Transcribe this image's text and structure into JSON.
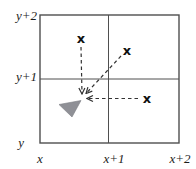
{
  "diagram": {
    "axis": {
      "y_labels": [
        "y+2",
        "y+1",
        "y"
      ],
      "x_labels": [
        "x",
        "x+1",
        "x+2"
      ]
    },
    "grid": {
      "rows": 2,
      "cols": 2,
      "line_color": "#4f4f4f"
    },
    "markers": {
      "glyph": "x",
      "color": "#101010",
      "points": [
        {
          "px": 81,
          "py": 38,
          "approx": "x+0.6, y+1.6"
        },
        {
          "px": 127,
          "py": 50,
          "approx": "x+1.25, y+1.45"
        },
        {
          "px": 147,
          "py": 98,
          "approx": "x+1.55, y+0.7"
        }
      ]
    },
    "arrows": {
      "color": "#333333",
      "dash": "3.5 3",
      "lines": [
        {
          "x1": 81,
          "y1": 47,
          "x2": 82,
          "y2": 94
        },
        {
          "x1": 121,
          "y1": 56,
          "x2": 86,
          "y2": 93.5
        },
        {
          "x1": 138,
          "y1": 98.5,
          "x2": 87,
          "y2": 98.5
        }
      ],
      "converge_approx": "x+0.6, y+0.7"
    },
    "pointer_triangle": {
      "fill": "#8f9096",
      "stroke": "#7c7d83",
      "points": "59,104.5 81,100.5 72,117"
    }
  }
}
